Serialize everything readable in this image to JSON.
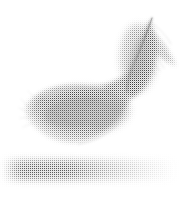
{
  "canvas": {
    "width": 190,
    "height": 200,
    "background_color": "#ffffff",
    "alt_text": "A single light grey feather with a soft shadow beneath it"
  },
  "subject": {
    "name": "feather",
    "description": "Single downy feather curving from upper right to lower left",
    "render_style": "halftone dot / dithered grayscale scan",
    "ink_color": "#8d8d8d",
    "darkest_value": "#9a9a9a",
    "lightest_value": "#f4f4f4",
    "parts": [
      {
        "name": "rachis",
        "label": "Shaft",
        "color": "#8a8a8a",
        "start": [
          152,
          18
        ],
        "end": [
          128,
          72
        ]
      },
      {
        "name": "upper-vane",
        "label": "Upper vane",
        "color": "#a8a8a8"
      },
      {
        "name": "lower-vane",
        "label": "Lower vane crescent",
        "color": "#9e9e9e"
      },
      {
        "name": "barbs",
        "label": "Barb strands",
        "color": "#bcbcbc"
      }
    ],
    "bounds": {
      "tip": [
        152,
        18
      ],
      "left_extent": [
        22,
        108
      ],
      "right_extent": [
        176,
        62
      ],
      "bottom_extent": [
        112,
        142
      ]
    }
  },
  "shadow": {
    "name": "cast-shadow",
    "label": "Cast shadow",
    "color": "#b4b4b4",
    "center": [
      78,
      170
    ],
    "width": 168,
    "height": 26,
    "darkest_region": [
      20,
      78
    ],
    "fade_direction": "left-to-right"
  }
}
